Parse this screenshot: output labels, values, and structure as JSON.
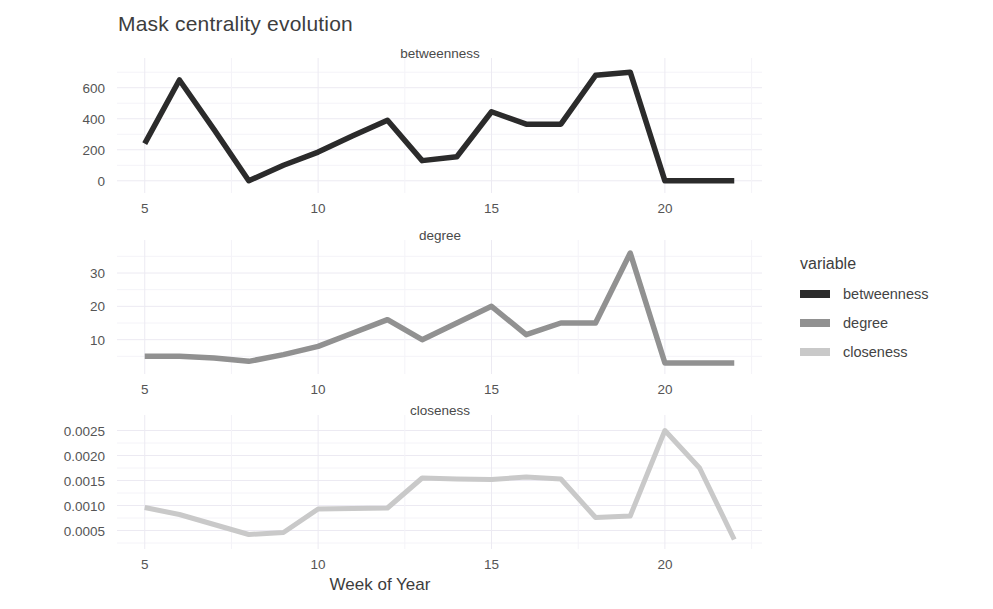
{
  "title": "Mask centrality evolution",
  "xlabel": "Week of Year",
  "legend": {
    "title": "variable",
    "items": [
      {
        "label": "betweenness",
        "color": "#2b2b2b"
      },
      {
        "label": "degree",
        "color": "#919191"
      },
      {
        "label": "closeness",
        "color": "#c9c9c9"
      }
    ]
  },
  "colors": {
    "betweenness": "#2b2b2b",
    "degree": "#919191",
    "closeness": "#c9c9c9",
    "grid": "#eceaf2",
    "text": "#4a4a4a"
  },
  "facets": [
    {
      "name": "betweenness",
      "strip_label": "betweenness",
      "yticks": [
        "0",
        "200",
        "400",
        "600"
      ],
      "xticks": [
        "5",
        "10",
        "15",
        "20"
      ]
    },
    {
      "name": "degree",
      "strip_label": "degree",
      "yticks": [
        "10",
        "20",
        "30"
      ],
      "xticks": [
        "5",
        "10",
        "15",
        "20"
      ]
    },
    {
      "name": "closeness",
      "strip_label": "closeness",
      "yticks": [
        "0.0005",
        "0.0010",
        "0.0015",
        "0.0020",
        "0.0025"
      ],
      "xticks": [
        "5",
        "10",
        "15",
        "20"
      ]
    }
  ],
  "chart_data": {
    "type": "line",
    "title": "Mask centrality evolution",
    "xlabel": "Week of Year",
    "ylabel": "",
    "grid": true,
    "legend_position": "right",
    "legend_title": "variable",
    "faceted": true,
    "facet_rows": [
      "betweenness",
      "degree",
      "closeness"
    ],
    "x": [
      5,
      6,
      7,
      8,
      9,
      10,
      11,
      12,
      13,
      14,
      15,
      16,
      17,
      18,
      19,
      20,
      21,
      22
    ],
    "xlim": [
      4.2,
      22.8
    ],
    "xticks": [
      5,
      10,
      15,
      20
    ],
    "series": [
      {
        "name": "betweenness",
        "color": "#2b2b2b",
        "ylim": [
          -40,
          740
        ],
        "yticks": [
          0,
          200,
          400,
          600
        ],
        "values": [
          240,
          650,
          330,
          0,
          100,
          185,
          290,
          390,
          130,
          155,
          445,
          365,
          365,
          680,
          700,
          0,
          0,
          0
        ]
      },
      {
        "name": "degree",
        "color": "#919191",
        "ylim": [
          1.5,
          37.5
        ],
        "yticks": [
          10,
          20,
          30
        ],
        "values": [
          5,
          5,
          4.5,
          3.5,
          5.5,
          8,
          12,
          16,
          10,
          15,
          20,
          11.5,
          15,
          15,
          36,
          3,
          3,
          3
        ]
      },
      {
        "name": "closeness",
        "color": "#c9c9c9",
        "ylim": [
          0.00025,
          0.00265
        ],
        "yticks": [
          0.0005,
          0.001,
          0.0015,
          0.002,
          0.0025
        ],
        "values": [
          0.00096,
          0.00082,
          0.00062,
          0.00042,
          0.00046,
          0.00093,
          0.00094,
          0.00095,
          0.00155,
          0.00153,
          0.00152,
          0.00157,
          0.00153,
          0.00076,
          0.00079,
          0.0025,
          0.00175,
          0.00032
        ]
      }
    ]
  }
}
